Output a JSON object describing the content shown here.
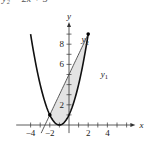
{
  "header": {
    "equation_fragment": "y₂ = 2x + 5"
  },
  "chart_data": {
    "type": "line",
    "title": "",
    "xlabel": "x",
    "ylabel": "y",
    "xlim": [
      -5.5,
      6.5
    ],
    "ylim": [
      -0.8,
      9.8
    ],
    "x_ticks": [
      -4,
      -3,
      -2,
      -1,
      1,
      2,
      3,
      4,
      5,
      6
    ],
    "x_tick_labels": [
      {
        "value": -4,
        "label": "−4"
      },
      {
        "value": -2,
        "label": "−2"
      },
      {
        "value": 2,
        "label": "2"
      },
      {
        "value": 4,
        "label": "4"
      }
    ],
    "y_ticks": [
      1,
      2,
      3,
      4,
      5,
      6,
      7,
      8,
      9
    ],
    "y_tick_labels": [
      {
        "value": 2,
        "label": "2"
      },
      {
        "value": 6,
        "label": "6"
      },
      {
        "value": 8,
        "label": "8"
      }
    ],
    "series": [
      {
        "name": "y1",
        "label": "y",
        "sub": "1",
        "equation": "y1 = x^2 + 2x + 1",
        "kind": "parabola",
        "coeffs": [
          1,
          2,
          1
        ],
        "x_range": [
          -4.0,
          2.0
        ],
        "color": "#111111"
      },
      {
        "name": "y2",
        "label": "y",
        "sub": "2",
        "equation": "y2 = 2x + 5",
        "kind": "line",
        "coeffs": [
          0,
          2,
          5
        ],
        "x_range": [
          -2.9,
          2.0
        ],
        "color": "#444444"
      }
    ],
    "shaded_region": {
      "between": [
        "y2",
        "y1"
      ],
      "x_from": -2,
      "x_to": 2,
      "color": "#e3e3e3"
    },
    "intersection_points": [
      {
        "x": -2,
        "y": 1
      },
      {
        "x": 2,
        "y": 9
      }
    ],
    "series_labels": [
      {
        "series": "y2",
        "x": 1.3,
        "y": 8.2
      },
      {
        "series": "y1",
        "x": 3.3,
        "y": 4.8
      }
    ],
    "grid": false,
    "legend": "none"
  }
}
